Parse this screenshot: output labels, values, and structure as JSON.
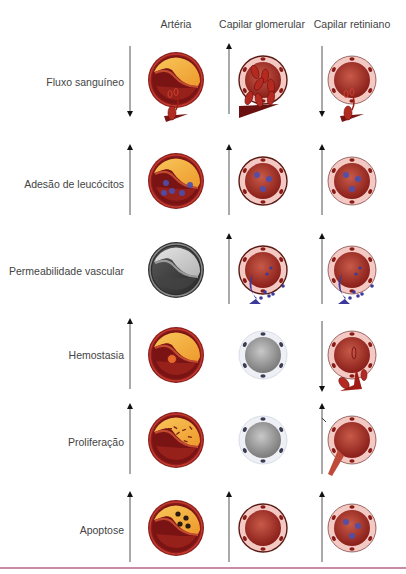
{
  "columns": [
    {
      "id": "arteria",
      "label": "Artéria"
    },
    {
      "id": "capilar_glomerular",
      "label": "Capilar glomerular"
    },
    {
      "id": "capilar_retiniano",
      "label": "Capilar retiniano"
    }
  ],
  "rows": [
    {
      "label": "Fluxo sanguíneo",
      "arteria": {
        "arrow": "down",
        "style": "artery",
        "feature": "rbc-exit"
      },
      "capilar_glomerular": {
        "arrow": "up",
        "style": "glomerular",
        "feature": "rbc-flood"
      },
      "capilar_retiniano": {
        "arrow": "down",
        "style": "retinal",
        "feature": "rbc-exit"
      }
    },
    {
      "label": "Adesão de leucócitos",
      "arteria": {
        "arrow": "up",
        "style": "artery",
        "feature": "leukocytes"
      },
      "capilar_glomerular": {
        "arrow": "up",
        "style": "glomerular",
        "feature": "leukocytes"
      },
      "capilar_retiniano": {
        "arrow": "up",
        "style": "retinal",
        "feature": "leukocytes"
      }
    },
    {
      "label": "Permeabilidade vascular",
      "arteria": {
        "arrow": "none",
        "style": "artery-gray",
        "feature": "none"
      },
      "capilar_glomerular": {
        "arrow": "up",
        "style": "glomerular",
        "feature": "leak"
      },
      "capilar_retiniano": {
        "arrow": "up",
        "style": "retinal",
        "feature": "leak"
      }
    },
    {
      "label": "Hemostasia",
      "arteria": {
        "arrow": "up",
        "style": "artery",
        "feature": "clot"
      },
      "capilar_glomerular": {
        "arrow": "none",
        "style": "capillary-gray",
        "feature": "none"
      },
      "capilar_retiniano": {
        "arrow": "down",
        "style": "retinal",
        "feature": "hemorrhage"
      }
    },
    {
      "label": "Proliferação",
      "arteria": {
        "arrow": "up",
        "style": "artery",
        "feature": "proliferation"
      },
      "capilar_glomerular": {
        "arrow": "none",
        "style": "capillary-gray",
        "feature": "none"
      },
      "capilar_retiniano": {
        "arrow": "up",
        "style": "retinal",
        "feature": "sprout"
      }
    },
    {
      "label": "Apoptose",
      "arteria": {
        "arrow": "up",
        "style": "artery",
        "feature": "apoptosis"
      },
      "capilar_glomerular": {
        "arrow": "up",
        "style": "glomerular-dark",
        "feature": "none"
      },
      "capilar_retiniano": {
        "arrow": "up",
        "style": "retinal-dark",
        "feature": "leukocytes"
      }
    }
  ],
  "colors": {
    "artery_wall": "#8a1c1c",
    "artery_ring": "#c0392b",
    "lumen": "#7a1414",
    "plaque": "#f2a93b",
    "capillary_membrane": "#f4c9c4",
    "glomerular_halo": "#f6e27a",
    "retinal_halo": "#8f8fd0",
    "leukocyte": "#4a4fb0",
    "rule": "#c98aa6"
  }
}
